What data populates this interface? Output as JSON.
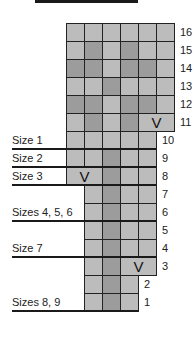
{
  "chart_data": {
    "type": "table",
    "title": "",
    "legend": {
      "L": "light stitch",
      "D": "dark stitch",
      "V": "decrease (spans 2 stitches)"
    },
    "colors": {
      "light": "#bcbcbc",
      "dark": "#9c9c9c",
      "grid": "#222222"
    },
    "rows": [
      {
        "row": 16,
        "start_col": 0,
        "cells": [
          "L",
          "L",
          "L",
          "L",
          "L",
          "L"
        ]
      },
      {
        "row": 15,
        "start_col": 0,
        "cells": [
          "L",
          "D",
          "L",
          "D",
          "L",
          "L"
        ]
      },
      {
        "row": 14,
        "start_col": 0,
        "cells": [
          "D",
          "D",
          "L",
          "D",
          "D",
          "L"
        ]
      },
      {
        "row": 13,
        "start_col": 0,
        "cells": [
          "L",
          "L",
          "D",
          "L",
          "L",
          "L"
        ]
      },
      {
        "row": 12,
        "start_col": 0,
        "cells": [
          "D",
          "D",
          "L",
          "D",
          "D",
          "L"
        ]
      },
      {
        "row": 11,
        "start_col": 0,
        "cells": [
          "L",
          "D",
          "L",
          "D",
          "V2"
        ]
      },
      {
        "row": 10,
        "start_col": 0,
        "cells": [
          "L",
          "L",
          "L",
          "L",
          "L"
        ]
      },
      {
        "row": 9,
        "start_col": 0,
        "cells": [
          "L",
          "L",
          "D",
          "L",
          "L"
        ]
      },
      {
        "row": 8,
        "start_col": 0,
        "cells": [
          "V2",
          "D",
          "L",
          "L"
        ]
      },
      {
        "row": 7,
        "start_col": 1,
        "cells": [
          "L",
          "D",
          "L",
          "L"
        ]
      },
      {
        "row": 6,
        "start_col": 1,
        "cells": [
          "L",
          "D",
          "L",
          "L"
        ]
      },
      {
        "row": 5,
        "start_col": 1,
        "cells": [
          "L",
          "D",
          "L",
          "L"
        ]
      },
      {
        "row": 4,
        "start_col": 1,
        "cells": [
          "L",
          "D",
          "L",
          "L"
        ]
      },
      {
        "row": 3,
        "start_col": 1,
        "cells": [
          "L",
          "D",
          "V2"
        ]
      },
      {
        "row": 2,
        "start_col": 1,
        "cells": [
          "L",
          "D",
          "L"
        ]
      },
      {
        "row": 1,
        "start_col": 1,
        "cells": [
          "L",
          "D",
          "L"
        ]
      }
    ],
    "size_markers": [
      {
        "label": "Size 1",
        "below_row": 10
      },
      {
        "label": "Size 2",
        "below_row": 9
      },
      {
        "label": "Size 3",
        "below_row": 8
      },
      {
        "label": "Sizes 4, 5, 6",
        "below_row": 6
      },
      {
        "label": "Size 7",
        "below_row": 4
      },
      {
        "label": "Sizes 8, 9",
        "below_row": 1
      }
    ],
    "decrease_symbol": "V"
  }
}
